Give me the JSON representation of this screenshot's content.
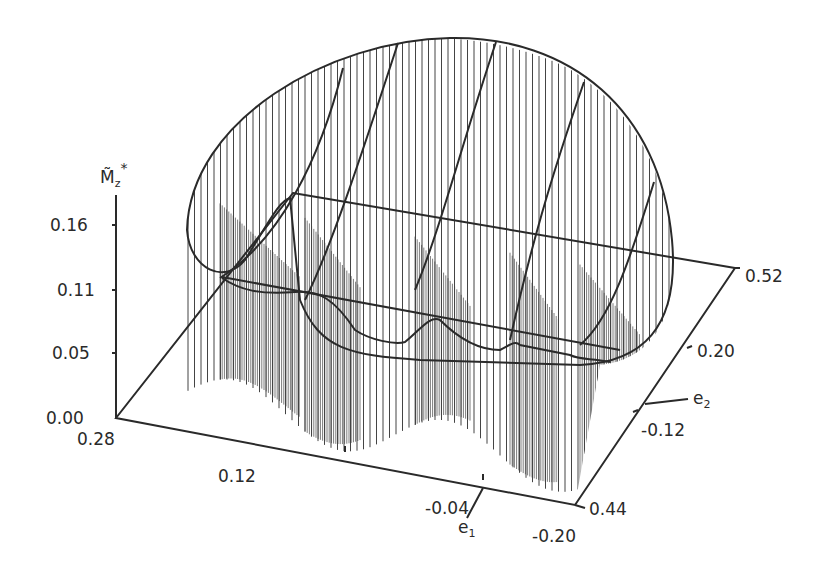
{
  "chart_data": {
    "type": "surface3d",
    "title": "",
    "zlabel": "M̃z*",
    "xlabel": "e1",
    "ylabel": "e2",
    "z_ticks": [
      "0.16",
      "0.11",
      "0.05",
      "0.00"
    ],
    "e1_ticks": [
      "0.28",
      "0.12",
      "-0.04",
      "-0.20"
    ],
    "e2_ticks": [
      "0.44",
      "-0.12",
      "0.20",
      "0.52"
    ],
    "z_range": [
      0.0,
      0.16
    ],
    "e1_range": [
      0.28,
      -0.2
    ],
    "e2_range": [
      -0.44,
      0.52
    ],
    "reference_plane_z": 0.11,
    "grid": false
  },
  "labels": {
    "z_axis": "M̃",
    "z_axis_sub": "z",
    "z_axis_sup": "*",
    "e1_axis": "e",
    "e1_sub": "1",
    "e2_axis": "e",
    "e2_sub": "2",
    "z_tick_016": "0.16",
    "z_tick_011": "0.11",
    "z_tick_005": "0.05",
    "z_tick_000": "0.00",
    "e1_tick_028": "0.28",
    "e1_tick_012": "0.12",
    "e1_tick_m004": "-0.04",
    "e1_tick_m020": "-0.20",
    "e2_tick_044": "0.44",
    "e2_tick_m012": "-0.12",
    "e2_tick_020": "0.20",
    "e2_tick_052": "0.52"
  }
}
